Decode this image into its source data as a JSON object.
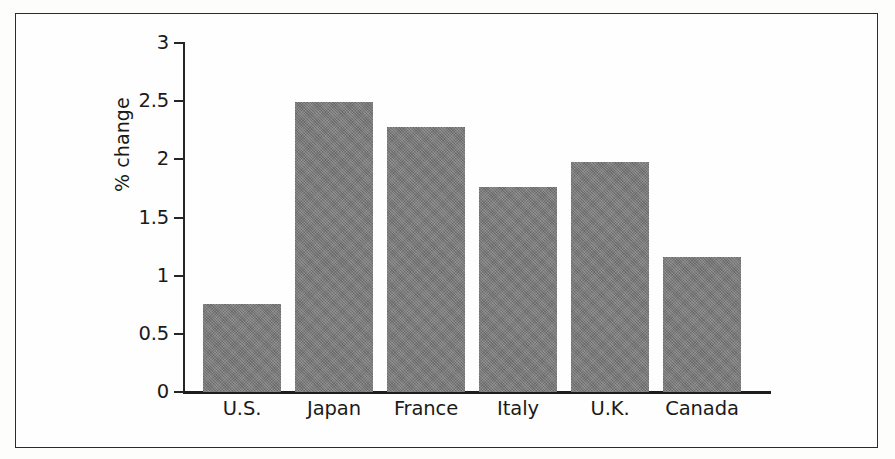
{
  "chart_data": {
    "type": "bar",
    "title": "",
    "subtitle": "",
    "xlabel": "",
    "ylabel": "% change",
    "categories": [
      "U.S.",
      "Japan",
      "France",
      "Italy",
      "U.K.",
      "Canada"
    ],
    "values": [
      0.76,
      2.49,
      2.28,
      1.76,
      1.98,
      1.16
    ],
    "ylim": [
      0,
      3
    ],
    "yticks": [
      0,
      0.5,
      1,
      1.5,
      2,
      2.5,
      3
    ],
    "ytick_labels": [
      "0",
      "0.5",
      "1",
      "1.5",
      "2",
      "2.5",
      "3"
    ],
    "grid": false,
    "legend": false,
    "legend_position": "none",
    "bar_color": "#797979",
    "axis_color": "#1d1d1d",
    "frame_color": "#2b2b2b",
    "background_color": "#fefefe"
  },
  "axes": {
    "y_title": "% change"
  }
}
